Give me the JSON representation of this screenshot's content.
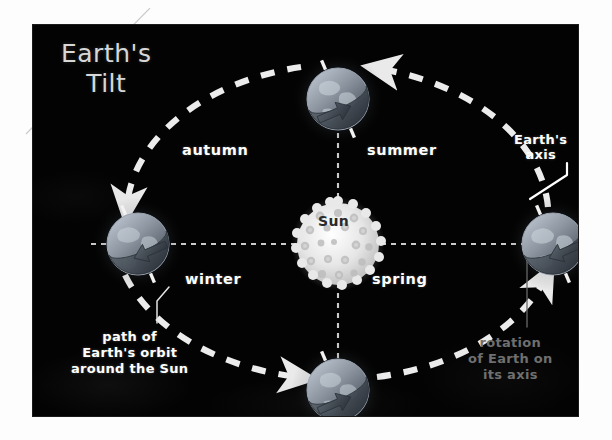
{
  "figure": {
    "title_line1": "Earth's",
    "title_line2": "Tilt",
    "background_color": "#030303",
    "page_background_color": "#ffffff",
    "text_color": "#ffffff",
    "dim_text_color": "#6f6f6f",
    "title_color": "#d7d7d7"
  },
  "sun": {
    "label": "Sun",
    "label_color": "#2a2a2a",
    "body_color": "#e8e8e8",
    "center": {
      "x": 305,
      "y": 219
    },
    "radius": 48
  },
  "seasons": [
    {
      "name": "autumn",
      "label": "autumn",
      "quadrant": "upper-left"
    },
    {
      "name": "summer",
      "label": "summer",
      "quadrant": "upper-right"
    },
    {
      "name": "winter",
      "label": "winter",
      "quadrant": "lower-left"
    },
    {
      "name": "spring",
      "label": "spring",
      "quadrant": "lower-right"
    }
  ],
  "callouts": [
    {
      "name": "earths-axis",
      "lines": [
        "Earth's",
        "axis"
      ],
      "text": "Earth's axis",
      "color": "#ffffff",
      "points_to": "right-globe-axis-tick"
    },
    {
      "name": "orbit-path",
      "lines": [
        "path of",
        "Earth's orbit",
        "around the Sun"
      ],
      "text": "path of Earth's orbit around the Sun",
      "color": "#ffffff",
      "points_to": "dashed-orbit-ellipse"
    },
    {
      "name": "rotation-of-earth",
      "lines": [
        "rotation",
        "of Earth on",
        "its axis"
      ],
      "text": "rotation of Earth on its axis",
      "color": "#6f6f6f",
      "points_to": "right-globe-rotation-arrow"
    }
  ],
  "globes": [
    {
      "position": "top",
      "season_at_position": "between summer and autumn",
      "cx": 305,
      "cy": 74,
      "r": 36
    },
    {
      "position": "right",
      "season_at_position": "between summer and spring",
      "cx": 520,
      "cy": 219,
      "r": 36
    },
    {
      "position": "bottom",
      "season_at_position": "between spring and winter",
      "cx": 305,
      "cy": 365,
      "r": 36
    },
    {
      "position": "left",
      "season_at_position": "between winter and autumn",
      "cx": 105,
      "cy": 219,
      "r": 36
    }
  ],
  "orbit": {
    "style": "dashed ellipse",
    "direction": "counter-clockwise",
    "arrow_count": 4,
    "color": "#e6e6e6"
  },
  "axes_guides": {
    "style": "dotted cross through Sun",
    "color": "#e0e0e0",
    "horizontal_y": 219,
    "vertical_x": 305
  }
}
